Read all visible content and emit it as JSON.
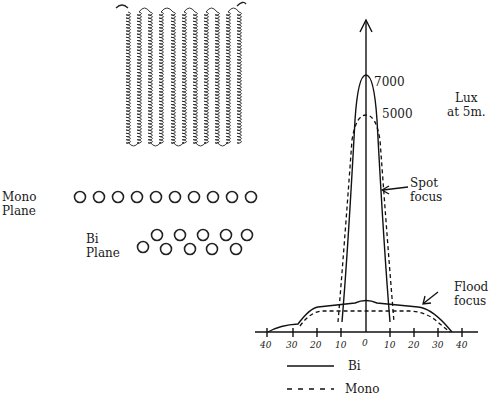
{
  "labels": {
    "mono_plane": [
      "Mono",
      "Plane"
    ],
    "bi_plane": [
      "Bi",
      "Plane"
    ],
    "peak_bi": "7000",
    "peak_mono": "5000",
    "unit": [
      "Lux",
      "at 5m."
    ],
    "spot": [
      "Spot",
      "focus"
    ],
    "flood": [
      "Flood",
      "focus"
    ],
    "legend_bi": "Bi",
    "legend_mono": "Mono"
  },
  "chart_data": {
    "type": "line",
    "title": "",
    "xlabel": "",
    "ylabel": "Lux at 5m.",
    "x_ticks": [
      "40",
      "30",
      "20",
      "10",
      "0",
      "10",
      "20",
      "30",
      "40"
    ],
    "annotations": [
      "7000",
      "5000",
      "Spot focus",
      "Flood focus"
    ],
    "series": [
      {
        "name": "Bi",
        "style": "solid",
        "spot_peak": 7000
      },
      {
        "name": "Mono",
        "style": "dashed",
        "spot_peak": 5000
      }
    ],
    "grid": false,
    "legend_position": "bottom"
  }
}
